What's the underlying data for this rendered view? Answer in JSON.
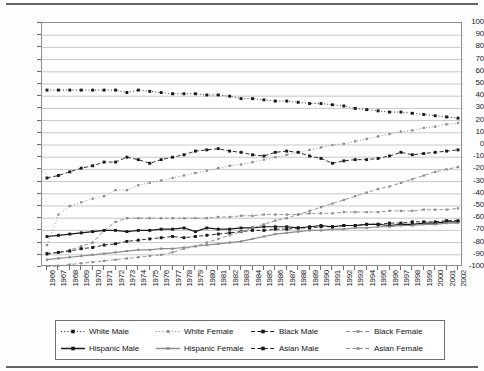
{
  "chart_data": {
    "type": "line",
    "title": "",
    "xlabel": "",
    "ylabel": "",
    "ylim": [
      -100,
      100
    ],
    "ytick_step": 10,
    "grid": true,
    "legend_position": "bottom",
    "x": [
      1966,
      1967,
      1968,
      1969,
      1970,
      1971,
      1972,
      1973,
      1974,
      1975,
      1976,
      1977,
      1978,
      1979,
      1980,
      1981,
      1982,
      1983,
      1984,
      1985,
      1986,
      1987,
      1988,
      1989,
      1990,
      1991,
      1992,
      1993,
      1994,
      1995,
      1996,
      1997,
      1998,
      1999,
      2000,
      2001,
      2002
    ],
    "yticks": [
      100,
      90,
      80,
      70,
      60,
      50,
      40,
      30,
      20,
      10,
      0,
      -10,
      -20,
      -30,
      -40,
      -50,
      -60,
      -70,
      -80,
      -90,
      -100
    ],
    "series": [
      {
        "name": "White Male",
        "style": "dotted",
        "marker": "square",
        "color": "#1a1a1a",
        "values": [
          45,
          45,
          45,
          45,
          45,
          45,
          45,
          43,
          45,
          44,
          43,
          42,
          42,
          42,
          41,
          41,
          40,
          38,
          38,
          37,
          36,
          36,
          35,
          34,
          34,
          33,
          32,
          30,
          29,
          28,
          27,
          27,
          26,
          25,
          24,
          23,
          22
        ]
      },
      {
        "name": "White Female",
        "style": "dotted",
        "marker": "square",
        "color": "#8c8c8c",
        "values": [
          -82,
          -57,
          -50,
          -47,
          -44,
          -42,
          -37,
          -37,
          -33,
          -31,
          -29,
          -27,
          -25,
          -23,
          -21,
          -19,
          -17,
          -16,
          -14,
          -12,
          -10,
          -8,
          -6,
          -4,
          -2,
          0,
          1,
          3,
          5,
          7,
          9,
          11,
          12,
          14,
          15,
          17,
          18
        ]
      },
      {
        "name": "Black Male",
        "style": "dashed",
        "marker": "square",
        "color": "#1a1a1a",
        "values": [
          -27,
          -25,
          -22,
          -19,
          -17,
          -14,
          -14,
          -10,
          -12,
          -15,
          -12,
          -10,
          -8,
          -5,
          -4,
          -3,
          -5,
          -6,
          -8,
          -9,
          -6,
          -5,
          -6,
          -9,
          -11,
          -15,
          -13,
          -12,
          -12,
          -11,
          -9,
          -6,
          -8,
          -7,
          -6,
          -5,
          -4
        ]
      },
      {
        "name": "Black Female",
        "style": "dashed",
        "marker": "square",
        "color": "#8c8c8c",
        "values": [
          -90,
          -88,
          -86,
          -83,
          -80,
          -70,
          -63,
          -60,
          -60,
          -60,
          -60,
          -60,
          -60,
          -60,
          -60,
          -59,
          -59,
          -58,
          -58,
          -57,
          -57,
          -57,
          -57,
          -56,
          -56,
          -56,
          -55,
          -55,
          -55,
          -55,
          -54,
          -54,
          -54,
          -53,
          -53,
          -53,
          -52
        ]
      },
      {
        "name": "Hispanic Male",
        "style": "solid",
        "marker": "square",
        "color": "#1a1a1a",
        "values": [
          -75,
          -74,
          -73,
          -72,
          -71,
          -70,
          -70,
          -71,
          -70,
          -70,
          -69,
          -69,
          -68,
          -71,
          -68,
          -69,
          -69,
          -68,
          -68,
          -67,
          -67,
          -67,
          -68,
          -67,
          -66,
          -67,
          -66,
          -66,
          -65,
          -65,
          -66,
          -65,
          -65,
          -64,
          -64,
          -63,
          -63
        ]
      },
      {
        "name": "Hispanic Female",
        "style": "solid",
        "marker": "square",
        "color": "#8c8c8c",
        "values": [
          -94,
          -93,
          -92,
          -91,
          -90,
          -89,
          -88,
          -87,
          -86,
          -86,
          -85,
          -85,
          -84,
          -83,
          -82,
          -81,
          -80,
          -79,
          -77,
          -75,
          -73,
          -72,
          -71,
          -70,
          -70,
          -69,
          -69,
          -68,
          -68,
          -67,
          -67,
          -66,
          -66,
          -65,
          -65,
          -64,
          -64
        ]
      },
      {
        "name": "Asian Male",
        "style": "dashed",
        "marker": "square",
        "color": "#1a1a1a",
        "values": [
          -89,
          -88,
          -87,
          -85,
          -84,
          -82,
          -81,
          -79,
          -78,
          -77,
          -76,
          -75,
          -76,
          -75,
          -74,
          -73,
          -72,
          -71,
          -70,
          -70,
          -69,
          -69,
          -68,
          -68,
          -67,
          -67,
          -66,
          -66,
          -65,
          -65,
          -64,
          -64,
          -63,
          -63,
          -63,
          -62,
          -62
        ]
      },
      {
        "name": "Asian Female",
        "style": "dashed",
        "marker": "square",
        "color": "#8c8c8c",
        "values": [
          -100,
          -99,
          -98,
          -97,
          -96,
          -95,
          -94,
          -93,
          -92,
          -91,
          -90,
          -88,
          -85,
          -83,
          -80,
          -77,
          -74,
          -71,
          -68,
          -65,
          -62,
          -60,
          -57,
          -54,
          -51,
          -48,
          -45,
          -42,
          -39,
          -36,
          -34,
          -31,
          -28,
          -25,
          -22,
          -20,
          -18
        ]
      }
    ]
  },
  "legend": {
    "items": [
      {
        "label": "White Male"
      },
      {
        "label": "White Female"
      },
      {
        "label": "Black Male"
      },
      {
        "label": "Black Female"
      },
      {
        "label": "Hispanic Male"
      },
      {
        "label": "Hispanic Female"
      },
      {
        "label": "Asian Male"
      },
      {
        "label": "Asian Female"
      }
    ]
  }
}
